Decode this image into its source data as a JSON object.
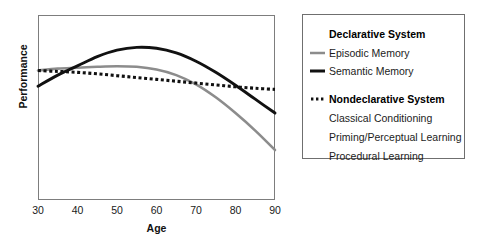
{
  "chart_data": {
    "type": "line",
    "title": "",
    "xlabel": "Age",
    "ylabel": "Performance",
    "xlim": [
      30,
      90
    ],
    "ylim": [
      0,
      1
    ],
    "xticks": [
      "30",
      "40",
      "50",
      "60",
      "70",
      "80",
      "90"
    ],
    "yticks": [],
    "grid": false,
    "legend_position": "right-outside",
    "x": [
      30,
      35,
      40,
      45,
      50,
      55,
      60,
      65,
      70,
      75,
      80,
      85,
      90
    ],
    "series": [
      {
        "name": "Episodic Memory",
        "group": "Declarative System",
        "style": "solid",
        "color": "#8c8c8c",
        "values": [
          0.7,
          0.71,
          0.715,
          0.72,
          0.723,
          0.72,
          0.705,
          0.675,
          0.625,
          0.555,
          0.47,
          0.375,
          0.27
        ]
      },
      {
        "name": "Semantic Memory",
        "group": "Declarative System",
        "style": "solid",
        "color": "#111111",
        "values": [
          0.615,
          0.675,
          0.725,
          0.775,
          0.81,
          0.825,
          0.82,
          0.795,
          0.75,
          0.69,
          0.62,
          0.545,
          0.47
        ]
      },
      {
        "name": "Nondeclarative System",
        "group": "Nondeclarative System",
        "style": "dotted",
        "color": "#111111",
        "values": [
          0.7,
          0.695,
          0.69,
          0.682,
          0.672,
          0.662,
          0.652,
          0.642,
          0.632,
          0.622,
          0.612,
          0.604,
          0.598
        ]
      }
    ]
  },
  "axes": {
    "x_title": "Age",
    "y_title": "Performance",
    "x_ticks": [
      {
        "label": "30",
        "value": 30
      },
      {
        "label": "40",
        "value": 40
      },
      {
        "label": "50",
        "value": 50
      },
      {
        "label": "60",
        "value": 60
      },
      {
        "label": "70",
        "value": 70
      },
      {
        "label": "80",
        "value": 80
      },
      {
        "label": "90",
        "value": 90
      }
    ]
  },
  "legend": {
    "declarative_heading": "Declarative System",
    "episodic_label": "Episodic Memory",
    "semantic_label": "Semantic Memory",
    "nondeclarative_heading": "Nondeclarative System",
    "classical_label": "Classical Conditioning",
    "priming_label": "Priming/Perceptual Learning",
    "procedural_label": "Procedural Learning"
  },
  "colors": {
    "episodic": "#8c8c8c",
    "semantic": "#111111",
    "nondeclarative": "#111111",
    "frame": "#7d7d7d",
    "legend_border": "#6f6f6f",
    "background": "#ffffff"
  }
}
